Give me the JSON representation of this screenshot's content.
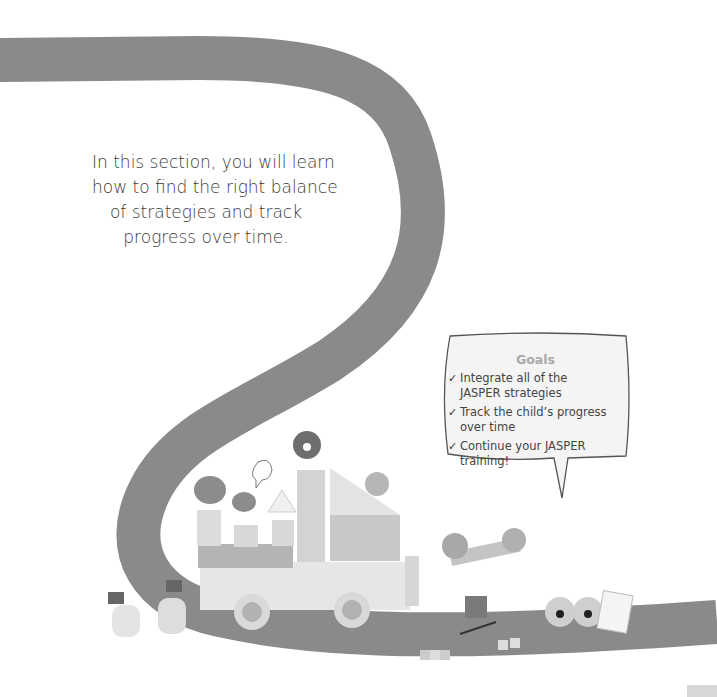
{
  "intro": {
    "lines": [
      "In this section, you will learn",
      "how to find the right balance",
      "of strategies and track",
      "progress over time."
    ]
  },
  "goals": {
    "title": "Goals",
    "check_icon": "✓",
    "items": [
      {
        "line1": "Integrate all of the",
        "line2": "JASPER strategies"
      },
      {
        "line1": "Track the child’s progress",
        "line2": "over time"
      },
      {
        "line1": "Continue your JASPER",
        "line2": "training!"
      }
    ]
  },
  "colors": {
    "road": "#8a8a8a",
    "text": "#3a3a3a",
    "goals_title": "#a9a9a9",
    "bubble_fill": "#f4f4f4",
    "bubble_stroke": "#555555"
  }
}
